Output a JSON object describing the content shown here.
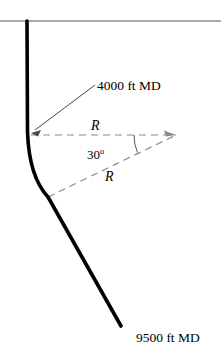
{
  "figure": {
    "colors": {
      "wellbore": "#000000",
      "surface_line": "#555555",
      "dashed_radius": "#8a8a8a",
      "leader_line": "#4a4a4a",
      "angle_arc": "#555555",
      "text": "#000000",
      "background": "#ffffff"
    }
  },
  "labels": {
    "kickoff_md": "4000 ft MD",
    "total_md": "9500 ft MD",
    "radius_upper": "R",
    "radius_lower": "R",
    "inclination_value": "30",
    "inclination_unit": "o"
  },
  "geometry": {
    "surface_line": {
      "y": 21,
      "x_start": 0,
      "x_end": 221
    },
    "wellhead": {
      "x": 27,
      "y": 21
    },
    "kickoff_point": {
      "x": 30,
      "y": 135
    },
    "end_of_build": {
      "x": 48,
      "y": 197
    },
    "well_terminus": {
      "x": 121,
      "y": 326
    },
    "curvature_center": {
      "x": 176,
      "y": 135
    },
    "inclination_deg": 30,
    "leader_from": {
      "x": 95,
      "y": 85
    },
    "leader_to": {
      "x": 33,
      "y": 131
    }
  }
}
